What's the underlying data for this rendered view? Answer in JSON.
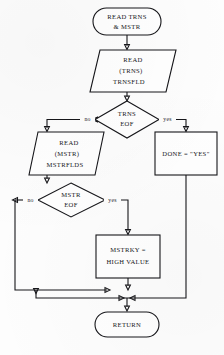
{
  "diagram": {
    "background": "#fdfdfd",
    "line_color": "#16161a",
    "text_color": "#16161a",
    "nodes": {
      "start": {
        "type": "terminator",
        "lines": [
          "READ  TRNS",
          "& MSTR"
        ]
      },
      "read_trns": {
        "type": "io-parallelogram",
        "lines": [
          "READ",
          "(TRNS)",
          "TRNSFLD"
        ]
      },
      "trns_eof": {
        "type": "decision",
        "lines": [
          "TRNS",
          "EOF"
        ]
      },
      "done_yes": {
        "type": "process",
        "lines": [
          "DONE = \"YES\""
        ]
      },
      "read_mstr": {
        "type": "io-parallelogram",
        "lines": [
          "READ",
          "(MSTR)",
          "MSTRFLDS"
        ]
      },
      "mstr_eof": {
        "type": "decision",
        "lines": [
          "MSTR",
          "EOF"
        ]
      },
      "mstrky": {
        "type": "process",
        "lines": [
          "MSTRKY =",
          "HIGH VALUE"
        ]
      },
      "return": {
        "type": "terminator",
        "lines": [
          "RETURN"
        ]
      }
    },
    "edge_labels": {
      "trns_no": "no",
      "trns_yes": "yes",
      "mstr_no": "no",
      "mstr_yes": "yes"
    }
  }
}
